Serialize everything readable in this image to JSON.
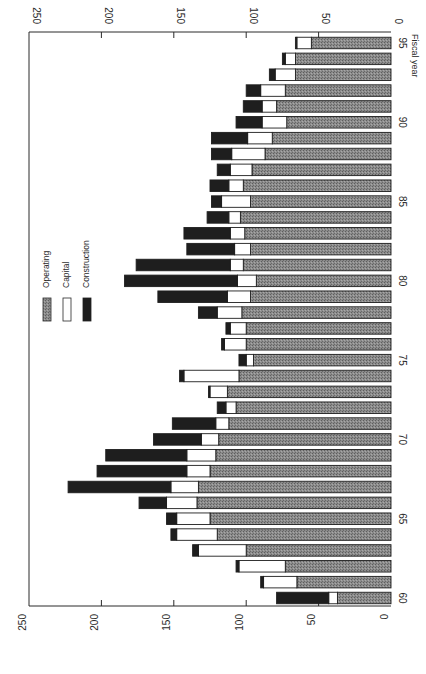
{
  "chart_data": {
    "type": "bar",
    "orientation": "horizontal-stacked (figure rotated 90°)",
    "title": "",
    "xlabel": "Fiscal year",
    "ylabel": "",
    "ylim": [
      0,
      250
    ],
    "value_ticks": [
      0,
      50,
      100,
      150,
      200,
      250
    ],
    "category_ticks": [
      "60",
      "65",
      "70",
      "75",
      "80",
      "85",
      "90",
      "95"
    ],
    "categories": [
      "60",
      "61",
      "62",
      "63",
      "64",
      "65",
      "66",
      "67",
      "68",
      "69",
      "70",
      "71",
      "72",
      "73",
      "74",
      "75",
      "76",
      "77",
      "78",
      "79",
      "80",
      "81",
      "82",
      "83",
      "84",
      "85",
      "86",
      "87",
      "88",
      "89",
      "90",
      "91",
      "92",
      "93",
      "94",
      "95"
    ],
    "series": [
      {
        "name": "Operating",
        "color": "#8a8a8a",
        "pattern": "stippled gray",
        "values": [
          37,
          65,
          73,
          100,
          120,
          125,
          134,
          133,
          125,
          121,
          119,
          112,
          107,
          113,
          105,
          95,
          100,
          100,
          103,
          97,
          93,
          102,
          97,
          101,
          104,
          97,
          102,
          96,
          87,
          82,
          72,
          79,
          73,
          66,
          66,
          55
        ]
      },
      {
        "name": "Capital",
        "color": "#ffffff",
        "pattern": "white",
        "values": [
          6,
          23,
          32,
          33,
          28,
          23,
          21,
          19,
          16,
          20,
          12,
          9,
          7,
          12,
          38,
          5,
          15,
          11,
          17,
          16,
          13,
          9,
          11,
          10,
          8,
          20,
          10,
          15,
          23,
          17,
          17,
          10,
          17,
          14,
          7,
          10
        ]
      },
      {
        "name": "Construction",
        "color": "#1e1e1e",
        "pattern": "solid black",
        "values": [
          36,
          2,
          2,
          4,
          4,
          7,
          19,
          71,
          62,
          56,
          33,
          30,
          6,
          1,
          3,
          5,
          2,
          3,
          13,
          48,
          78,
          65,
          33,
          32,
          15,
          7,
          13,
          9,
          14,
          25,
          18,
          13,
          10,
          4,
          2,
          1
        ]
      }
    ],
    "legend": {
      "position": "upper-left (rotated)",
      "entries": [
        "Operating",
        "Capital",
        "Construction"
      ]
    },
    "grid": false
  },
  "axis": {
    "value_tick_labels": [
      "0",
      "50",
      "100",
      "150",
      "200",
      "250"
    ],
    "category_tick_labels": [
      "60",
      "65",
      "70",
      "75",
      "80",
      "85",
      "90",
      "95"
    ],
    "category_title": "Fiscal year"
  },
  "legend": {
    "items": [
      {
        "label": "Operating"
      },
      {
        "label": "Capital"
      },
      {
        "label": "Construction"
      }
    ]
  }
}
